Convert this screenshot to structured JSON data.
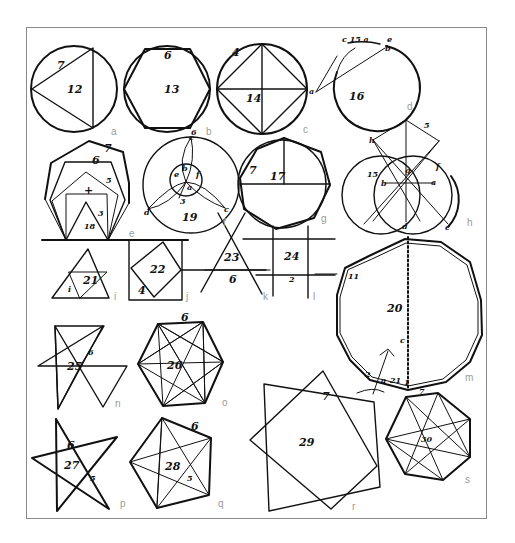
{
  "page": {
    "frame_color": "#8a8a8a",
    "ink_color": "#111111",
    "caption_letter_color": "#9a9a9a"
  },
  "figures": [
    {
      "panel": "a",
      "shape": "triangle inscribed in circle",
      "number": "12",
      "side_label": "7"
    },
    {
      "panel": "b",
      "shape": "hexagon inscribed in circle",
      "number": "13",
      "side_label": "6",
      "extra": "6"
    },
    {
      "panel": "c",
      "shape": "square inscribed in circle with diagonals",
      "number": "14",
      "side_label": "4",
      "point": "a"
    },
    {
      "panel": "d",
      "shape": "circle with chord construction",
      "number": "16",
      "arc_label": "c 15 a",
      "points": [
        "e",
        "b",
        "a"
      ]
    },
    {
      "panel": "e",
      "shape": "nested polygons on common base",
      "number": "18",
      "labels": [
        "7",
        "6",
        "5",
        "4",
        "3"
      ]
    },
    {
      "panel": "f",
      "shape": "three-lobed circle construction",
      "number": "19",
      "points": [
        "c",
        "e",
        "b",
        "f",
        "a",
        "d",
        "c"
      ]
    },
    {
      "panel": "g",
      "shape": "heptagon inscribed in circle",
      "number": "17",
      "side_label": "7"
    },
    {
      "panel": "h",
      "shape": "pentagon from intersecting circles",
      "number": "15",
      "points": [
        "h",
        "5",
        "b",
        "g",
        "a",
        "f",
        "d",
        "c"
      ]
    },
    {
      "panel": "i",
      "shape": "subdivided triangle",
      "number": "21",
      "inner": "i"
    },
    {
      "panel": "j",
      "shape": "square rotated in square",
      "number": "22",
      "side_label": "4"
    },
    {
      "panel": "k",
      "shape": "crossing lines forming triangle",
      "number": "23",
      "side_label": "6"
    },
    {
      "panel": "l",
      "shape": "grid of crossing lines",
      "number": "24",
      "side_label": "2"
    },
    {
      "panel": "m",
      "shape": "large 11/12-gon in circle with dotted diameter",
      "number": "20",
      "side_label": "11",
      "bottom_labels": [
        "2",
        "a",
        "21",
        "1"
      ],
      "marker": "c"
    },
    {
      "panel": "n",
      "shape": "six-pointed star",
      "number": "25",
      "side_label": "6"
    },
    {
      "panel": "o",
      "shape": "hexagon with inscribed star",
      "number": "26",
      "side_label": "6"
    },
    {
      "panel": "p",
      "shape": "five-pointed star",
      "number": "27",
      "labels": [
        "6",
        "5"
      ]
    },
    {
      "panel": "q",
      "shape": "pentagon with diagonals",
      "number": "28",
      "labels": [
        "6",
        "5"
      ]
    },
    {
      "panel": "r",
      "shape": "two overlapping squares (eight-pointed star)",
      "number": "29",
      "side_label": "7"
    },
    {
      "panel": "s",
      "shape": "heptagon with heptagram",
      "number": "30",
      "side_label": "7"
    }
  ],
  "labels": {
    "a": {
      "num": "12",
      "side": "7",
      "letter": "a"
    },
    "b": {
      "num": "13",
      "side": "6",
      "extra": "6",
      "letter": "b"
    },
    "c": {
      "num": "14",
      "side": "4",
      "pt": "a",
      "letter": "c"
    },
    "d": {
      "num": "16",
      "arc": "c 15 a",
      "e": "e",
      "b": "b",
      "a": "a",
      "letter": "d"
    },
    "e": {
      "num": "18",
      "l7": "7",
      "l6": "6",
      "l5": "5",
      "l4": "+",
      "l3": "3",
      "letter": "e"
    },
    "f": {
      "num": "19",
      "c1": "c",
      "e": "e",
      "b": "b",
      "f": "f",
      "a": "a",
      "d": "d",
      "c2": "c",
      "three": "3",
      "seven": "1",
      "letter": "f"
    },
    "g": {
      "num": "17",
      "side": "7",
      "letter": "g"
    },
    "h": {
      "num": "15",
      "h": "h",
      "five": "5",
      "b": "b",
      "g": "g",
      "a": "a",
      "f": "f",
      "d": "d",
      "c": "c",
      "letter": "h"
    },
    "i": {
      "num": "21",
      "inner": "i",
      "letter": "i"
    },
    "j": {
      "num": "22",
      "side": "4",
      "letter": "j"
    },
    "k": {
      "num": "23",
      "side": "6",
      "letter": "k"
    },
    "l": {
      "num": "24",
      "side": "2",
      "letter": "l"
    },
    "m": {
      "num": "20",
      "side": "11",
      "b2": "2",
      "ba": "a",
      "b21": "21",
      "b1": "1",
      "mk": "c",
      "letter": "m"
    },
    "n": {
      "num": "25",
      "side": "6",
      "letter": "n"
    },
    "o": {
      "num": "26",
      "side": "6",
      "letter": "o"
    },
    "p": {
      "num": "27",
      "l6": "6",
      "l5": "5",
      "letter": "p"
    },
    "q": {
      "num": "28",
      "l6": "6",
      "l5": "5",
      "letter": "q"
    },
    "r": {
      "num": "29",
      "side": "7",
      "letter": "r"
    },
    "s": {
      "num": "30",
      "side": "7",
      "letter": "s"
    }
  }
}
